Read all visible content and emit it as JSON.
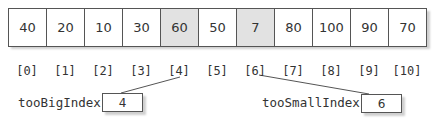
{
  "array": {
    "values": [
      "40",
      "20",
      "10",
      "30",
      "60",
      "50",
      "7",
      "80",
      "100",
      "90",
      "70"
    ],
    "indices": [
      "[0]",
      "[1]",
      "[2]",
      "[3]",
      "[4]",
      "[5]",
      "[6]",
      "[7]",
      "[8]",
      "[9]",
      "[10]"
    ],
    "highlighted": [
      4,
      6
    ],
    "highlight_color": "#e2e2e2"
  },
  "pointers": {
    "too_big": {
      "label": "tooBigIndex",
      "value": "4",
      "points_to": 4
    },
    "too_small": {
      "label": "tooSmallIndex",
      "value": "6",
      "points_to": 6
    }
  }
}
